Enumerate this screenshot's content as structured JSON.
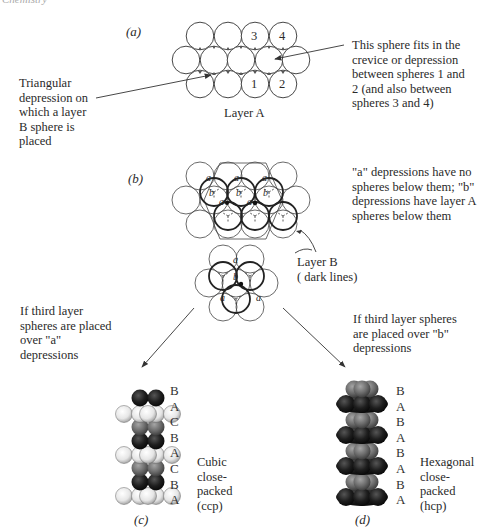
{
  "header": {
    "running_title": "Chemistry"
  },
  "panel_a": {
    "label": "(a)",
    "layer_title": "Layer A",
    "sphere_numbers": [
      "3",
      "4",
      "1",
      "2"
    ],
    "left_note": [
      "Triangular",
      "depression on",
      "which a layer",
      "B sphere is",
      "placed"
    ],
    "right_note": [
      "This sphere fits in the",
      "crevice or depression",
      "between spheres 1 and",
      "2 (and also between",
      "spheres 3 and 4)"
    ]
  },
  "panel_b": {
    "label": "(b)",
    "right_note": [
      "\"a\" depressions have no",
      "spheres below them; \"b\"",
      "depressions have layer A",
      "spheres below them"
    ],
    "layer_b_label": [
      "Layer B",
      "( dark lines)"
    ],
    "depression_a": "a",
    "depression_b": "b"
  },
  "branches": {
    "left_note": [
      "If third layer",
      "spheres are placed",
      "over \"a\"",
      "depressions"
    ],
    "right_note": [
      "If third layer spheres",
      "are placed over \"b\"",
      "depressions"
    ]
  },
  "panel_c": {
    "label": "(c)",
    "layers": [
      "B",
      "A",
      "C",
      "B",
      "A",
      "C",
      "B",
      "A"
    ],
    "description": [
      "Cubic",
      "close-",
      "packed",
      "(ccp)"
    ]
  },
  "panel_d": {
    "label": "(d)",
    "layers": [
      "B",
      "A",
      "B",
      "A",
      "B",
      "A",
      "B",
      "A"
    ],
    "description": [
      "Hexagonal",
      "close-",
      "packed",
      "(hcp)"
    ]
  },
  "colors": {
    "line": "#333333",
    "sphere_black": "#1e1e1e",
    "sphere_gray": "#6b6b6b",
    "sphere_light": "#e6e6e6"
  }
}
